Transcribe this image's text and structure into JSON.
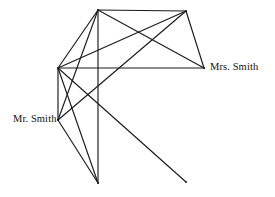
{
  "figure": {
    "type": "graph-diagram",
    "background_color": "#ffffff",
    "line_color": "#1a1a1a",
    "width": 275,
    "height": 197
  },
  "labels": {
    "mr_smith": "Mr. Smith",
    "mrs_smith": "Mrs. Smith"
  },
  "graph_data": {
    "type": "node-link",
    "vertices": [
      {
        "id": "A",
        "name": "top-left",
        "x": 98,
        "y": 10,
        "label": ""
      },
      {
        "id": "B",
        "name": "top-right",
        "x": 186,
        "y": 11,
        "label": ""
      },
      {
        "id": "C",
        "name": "left-hub",
        "x": 58,
        "y": 68,
        "label": ""
      },
      {
        "id": "D",
        "name": "mrs-smith",
        "x": 204,
        "y": 68,
        "label": "Mrs. Smith"
      },
      {
        "id": "E",
        "name": "mr-smith",
        "x": 58,
        "y": 120,
        "label": "Mr. Smith"
      },
      {
        "id": "F",
        "name": "bottom",
        "x": 98,
        "y": 183,
        "label": ""
      },
      {
        "id": "G",
        "name": "bottom-right",
        "x": 186,
        "y": 182,
        "label": ""
      }
    ],
    "edges": [
      {
        "from": "A",
        "to": "B"
      },
      {
        "from": "A",
        "to": "C"
      },
      {
        "from": "A",
        "to": "D"
      },
      {
        "from": "A",
        "to": "E"
      },
      {
        "from": "A",
        "to": "F"
      },
      {
        "from": "B",
        "to": "C"
      },
      {
        "from": "B",
        "to": "D"
      },
      {
        "from": "B",
        "to": "E"
      },
      {
        "from": "C",
        "to": "D"
      },
      {
        "from": "C",
        "to": "E"
      },
      {
        "from": "C",
        "to": "F"
      },
      {
        "from": "C",
        "to": "G"
      },
      {
        "from": "E",
        "to": "F"
      }
    ]
  }
}
